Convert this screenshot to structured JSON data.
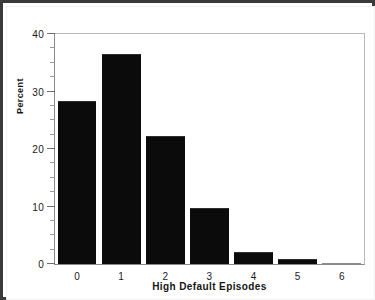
{
  "chart_data": {
    "type": "bar",
    "title": "",
    "xlabel": "High Default Episodes",
    "ylabel": "Percent",
    "categories": [
      "0",
      "1",
      "2",
      "3",
      "4",
      "5",
      "6"
    ],
    "values": [
      28.4,
      36.6,
      22.2,
      9.8,
      2.1,
      0.8,
      0.1
    ],
    "ylim": [
      0,
      40
    ],
    "yticks": [
      "0",
      "10",
      "20",
      "30",
      "40"
    ],
    "ytick_values": [
      0,
      10,
      20,
      30,
      40
    ],
    "yminor_values": [
      2.5,
      5,
      7.5,
      12.5,
      15,
      17.5,
      22.5,
      25,
      27.5,
      32.5,
      35,
      37.5
    ],
    "grid": false,
    "legend": null,
    "bar_color": "#0b0b0b",
    "frame_color": "#8a8a8a",
    "background": "#ffffff",
    "border_color": "#3a3a3a"
  }
}
